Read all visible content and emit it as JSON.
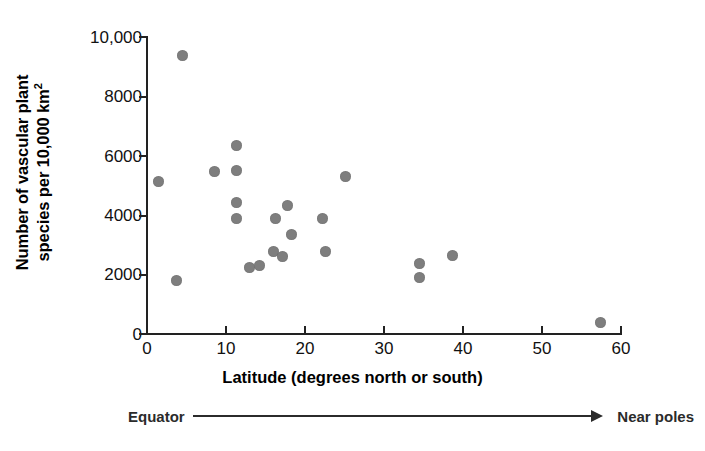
{
  "chart_data": {
    "type": "scatter",
    "title": "",
    "xlabel": "Latitude (degrees north or south)",
    "ylabel_line1": "Number of vascular plant",
    "ylabel_line2": "species per 10,000 km",
    "ylabel_superscript": "2",
    "xlim": [
      0,
      60
    ],
    "ylim": [
      0,
      10000
    ],
    "grid": false,
    "legend": "none",
    "xticks": [
      0,
      10,
      20,
      30,
      40,
      50,
      60
    ],
    "xtick_labels": [
      "0",
      "10",
      "20",
      "30",
      "40",
      "50",
      "60"
    ],
    "yticks": [
      0,
      2000,
      4000,
      6000,
      8000,
      10000
    ],
    "ytick_labels": [
      "0",
      "2000",
      "4000",
      "6000",
      "8000",
      "10,000"
    ],
    "point_color": "#7e7e7e",
    "points": [
      {
        "x": 4.5,
        "y": 9380
      },
      {
        "x": 1.5,
        "y": 5150
      },
      {
        "x": 3.8,
        "y": 1800
      },
      {
        "x": 8.5,
        "y": 5470
      },
      {
        "x": 11.3,
        "y": 6350
      },
      {
        "x": 11.3,
        "y": 5520
      },
      {
        "x": 11.3,
        "y": 4430
      },
      {
        "x": 11.3,
        "y": 3900
      },
      {
        "x": 13.0,
        "y": 2230
      },
      {
        "x": 14.3,
        "y": 2300
      },
      {
        "x": 16.3,
        "y": 3880
      },
      {
        "x": 16.0,
        "y": 2780
      },
      {
        "x": 17.2,
        "y": 2620
      },
      {
        "x": 17.8,
        "y": 4340
      },
      {
        "x": 18.3,
        "y": 3350
      },
      {
        "x": 22.3,
        "y": 3880
      },
      {
        "x": 22.7,
        "y": 2770
      },
      {
        "x": 25.2,
        "y": 5300
      },
      {
        "x": 34.6,
        "y": 2380
      },
      {
        "x": 34.6,
        "y": 1900
      },
      {
        "x": 38.8,
        "y": 2650
      },
      {
        "x": 57.5,
        "y": 380
      }
    ],
    "annotation": {
      "left_label": "Equator",
      "right_label": "Near poles",
      "arrow": "right-arrow"
    }
  }
}
